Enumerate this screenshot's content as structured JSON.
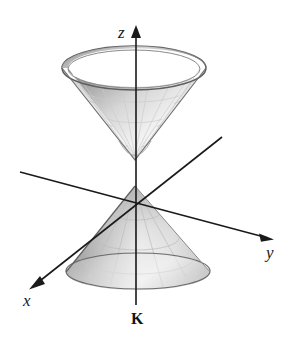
{
  "figure": {
    "name": "light-cone-double-cone-diagram",
    "background_color": "#ffffff",
    "width": 288,
    "height": 339
  },
  "axes": {
    "z": {
      "label": "z",
      "style": "italic-serif",
      "color": "#1a1a1a",
      "direction": "vertical-up",
      "arrow_tip": [
        136,
        27
      ],
      "line_start": [
        136,
        27
      ],
      "line_end": [
        136,
        305
      ]
    },
    "y": {
      "label": "y",
      "style": "italic-serif",
      "color": "#1a1a1a",
      "direction": "lower-right",
      "arrow_tip": [
        272,
        239
      ],
      "line_start": [
        20,
        172
      ],
      "line_end": [
        272,
        239
      ]
    },
    "x": {
      "label": "x",
      "style": "italic-serif",
      "color": "#1a1a1a",
      "direction": "lower-left",
      "arrow_tip": [
        31,
        288
      ],
      "line_start": [
        222,
        137
      ],
      "line_end": [
        31,
        288
      ]
    }
  },
  "annotations": [
    {
      "name": "origin-point-label",
      "text": "K",
      "style": "bold-serif",
      "color": "#111111",
      "position": [
        137,
        319
      ]
    }
  ],
  "surfaces": {
    "upper_cone": {
      "name": "upper-cone",
      "description": "inverted cone opening upward with visible interior",
      "apex": [
        135,
        160
      ],
      "rim_center": [
        134,
        68
      ],
      "rim_rx": 72,
      "rim_ry": 22,
      "fill_light": "#fcfcfc",
      "fill_mid": "#d8d8d8",
      "fill_dark": "#9a9a9a",
      "edge_color": "#5a5a5a"
    },
    "lower_cone": {
      "name": "lower-cone",
      "description": "cone pointing upward with elliptical base",
      "apex": [
        135,
        186
      ],
      "base_center": [
        138,
        271
      ],
      "base_rx": 72,
      "base_ry": 18,
      "fill_light": "#fbfbfb",
      "fill_mid": "#d0d0d0",
      "fill_dark": "#8f8f8f",
      "edge_color": "#5a5a5a"
    }
  },
  "colors": {
    "line": "#1a1a1a",
    "mesh": "#b9b9b9",
    "background": "#ffffff"
  }
}
